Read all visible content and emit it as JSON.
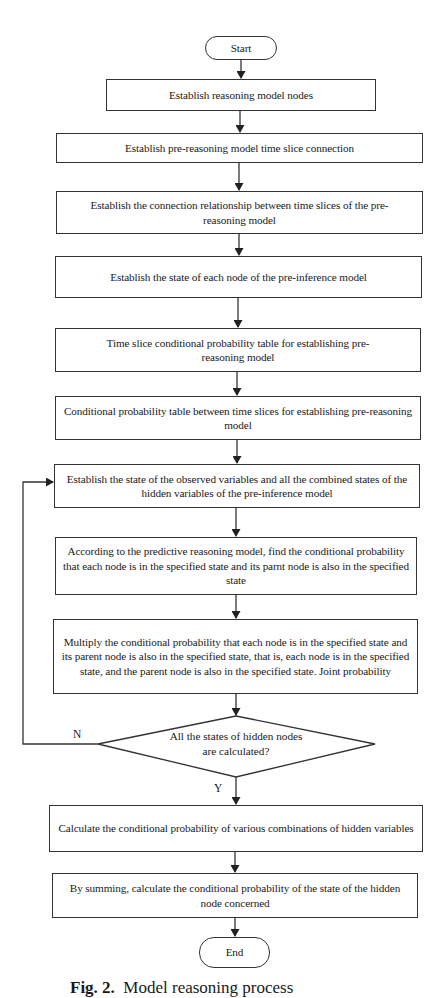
{
  "flowchart": {
    "start": "Start",
    "end": "End",
    "steps": [
      "Establish reasoning model nodes",
      "Establish pre-reasoning model time slice connection",
      "Establish the connection relationship between time slices of the pre-reasoning model",
      "Establish the state of each node of the pre-inference model",
      "Time slice conditional probability table for establishing pre-reasoning model",
      "Conditional probability table between time slices for establishing pre-reasoning model",
      "Establish the state of the observed variables and all the combined states of the hidden variables of the pre-inference model",
      "According to the predictive reasoning model, find the conditional probability that each node is in the specified state and its parnt node is also in the specified state",
      "Multiply the conditional probability that each node is in the specified state and its parent node is also in the specified state, that is, each node is in the specified state, and the parent node is also in the specified state. Joint probability"
    ],
    "decision": {
      "text": "All the states of hidden nodes are calculated?",
      "no_label": "N",
      "yes_label": "Y"
    },
    "after_steps": [
      "Calculate the conditional probability of various combinations of hidden variables",
      "By summing, calculate the conditional probability of the state of the hidden node concerned"
    ]
  },
  "caption": {
    "label": "Fig. 2.",
    "text": "Model reasoning process"
  }
}
